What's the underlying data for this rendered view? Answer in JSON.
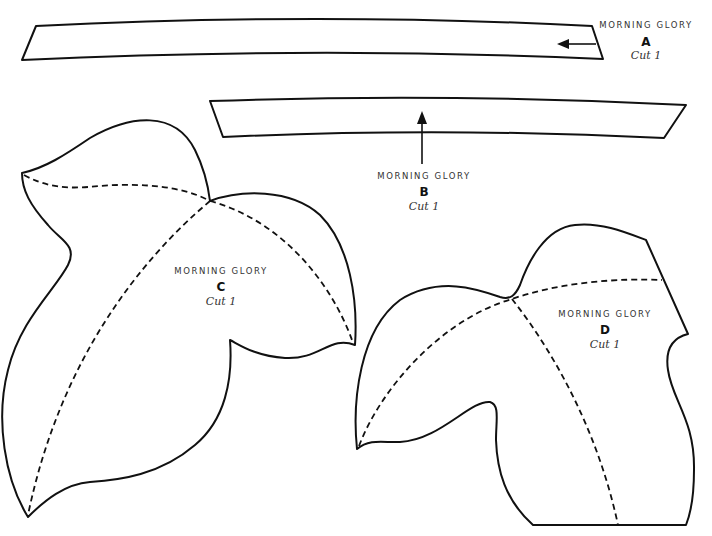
{
  "pattern": {
    "colors": {
      "line": "#111111",
      "background": "#ffffff",
      "text": "#333333"
    },
    "pieces": [
      {
        "id": "A",
        "title": "MORNING GLORY",
        "letter": "A",
        "instruction": "Cut 1",
        "shape": "curved-strip",
        "grainline": "arrow-left"
      },
      {
        "id": "B",
        "title": "MORNING GLORY",
        "letter": "B",
        "instruction": "Cut 1",
        "shape": "curved-strip",
        "grainline": "arrow-up"
      },
      {
        "id": "C",
        "title": "MORNING GLORY",
        "letter": "C",
        "instruction": "Cut 1",
        "shape": "three-lobed-leaf",
        "fold_lines": "dashed"
      },
      {
        "id": "D",
        "title": "MORNING GLORY",
        "letter": "D",
        "instruction": "Cut 1",
        "shape": "three-lobed-leaf",
        "fold_lines": "dashed"
      }
    ]
  }
}
